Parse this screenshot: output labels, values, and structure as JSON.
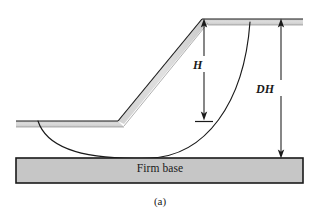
{
  "figure": {
    "caption": "(a)",
    "title_concept": "slope-stability-cross-section"
  },
  "labels": {
    "slope_height": "H",
    "depth_factor_height": "DH",
    "firm_base": "Firm base"
  },
  "colors": {
    "line": "#1a1a1a",
    "soil_fill": "#d9d9d9",
    "firm_base_fill": "#c6c6c6",
    "background": "#ffffff",
    "text": "#1a1a1a"
  },
  "geometry": {
    "canvas_width": 320,
    "canvas_height": 218,
    "crest_x": 202,
    "crest_y": 19,
    "toe_x": 118,
    "toe_y": 121,
    "ground_left_x": 16,
    "ground_surface_y": 121,
    "ground_band_thickness": 6,
    "top_surface_right_x": 303,
    "firm_base": {
      "x": 16,
      "y": 158,
      "width": 287,
      "height": 25
    },
    "slip_circle": {
      "entry_x": 38,
      "entry_y": 122,
      "tangent_x": 150,
      "tangent_y": 158,
      "exit_x": 250,
      "exit_y": 22
    },
    "dimension_H": {
      "x": 204,
      "top_y": 20,
      "bottom_y": 119
    },
    "dimension_DH": {
      "x": 281,
      "top_y": 22,
      "bottom_y": 157
    }
  },
  "elements": {
    "slope_face_name": "slope-face",
    "ground_surface_name": "ground-surface",
    "crest_surface_name": "crest-surface",
    "failure_arc_name": "failure-surface-arc"
  }
}
